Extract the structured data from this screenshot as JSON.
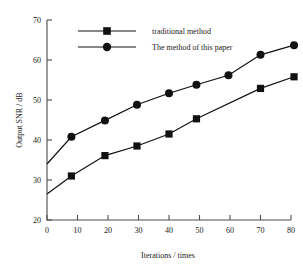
{
  "chart_data": {
    "type": "line",
    "title": "",
    "xlabel": "Iterations / times",
    "ylabel": "Output SNR / dB",
    "xlim": [
      0,
      80
    ],
    "ylim": [
      20,
      70
    ],
    "xticks": [
      0,
      10,
      20,
      30,
      40,
      50,
      60,
      70,
      80
    ],
    "yticks": [
      20,
      30,
      40,
      50,
      60,
      70
    ],
    "grid": false,
    "legend_position": "top-left",
    "series": [
      {
        "name": "traditional method",
        "marker": "square",
        "color": "#111111",
        "x": [
          0,
          8,
          19,
          29.5,
          40,
          49,
          70,
          81
        ],
        "values": [
          26.5,
          31.0,
          36.1,
          38.5,
          41.5,
          45.3,
          52.9,
          55.8
        ]
      },
      {
        "name": "The method of this paper",
        "marker": "circle",
        "color": "#111111",
        "x": [
          0,
          8,
          19,
          29.5,
          40,
          49,
          59.5,
          70,
          81
        ],
        "values": [
          34.0,
          40.8,
          44.9,
          48.8,
          51.7,
          53.8,
          56.2,
          61.3,
          63.7
        ]
      }
    ]
  },
  "legend": {
    "items": [
      {
        "label": "traditional method",
        "marker": "square"
      },
      {
        "label": "The method of this paper",
        "marker": "circle"
      }
    ]
  },
  "axes": {
    "x_tick_labels": [
      "0",
      "10",
      "20",
      "30",
      "40",
      "50",
      "60",
      "70",
      "80"
    ],
    "y_tick_labels": [
      "20",
      "30",
      "40",
      "50",
      "60",
      "70"
    ],
    "x_axis_title": "Iterations / times",
    "y_axis_title": "Output SNR / dB"
  }
}
